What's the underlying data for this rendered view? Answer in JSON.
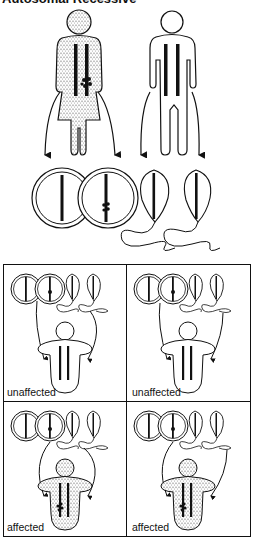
{
  "figure": {
    "title": "Autosomal Recessive",
    "title_clipped": true,
    "parents": [
      {
        "role": "mother",
        "status": "carrier",
        "shaded": true,
        "chromosomes": 2,
        "mutant_chromosomes": 1
      },
      {
        "role": "father",
        "status": "unaffected",
        "shaded": false,
        "chromosomes": 2,
        "mutant_chromosomes": 0
      }
    ],
    "gametes": [
      {
        "type": "egg",
        "mutant": false
      },
      {
        "type": "egg",
        "mutant": true
      },
      {
        "type": "sperm",
        "mutant": false
      },
      {
        "type": "sperm",
        "mutant": false
      }
    ],
    "outcomes": [
      {
        "position": "top-left",
        "label": "unaffected",
        "affected": false
      },
      {
        "position": "top-right",
        "label": "unaffected",
        "affected": false
      },
      {
        "position": "bottom-left",
        "label": "affected",
        "affected": true
      },
      {
        "position": "bottom-right",
        "label": "affected",
        "affected": true
      }
    ],
    "colors": {
      "line": "#111111",
      "background": "#ffffff",
      "stipple": "#777777"
    }
  }
}
